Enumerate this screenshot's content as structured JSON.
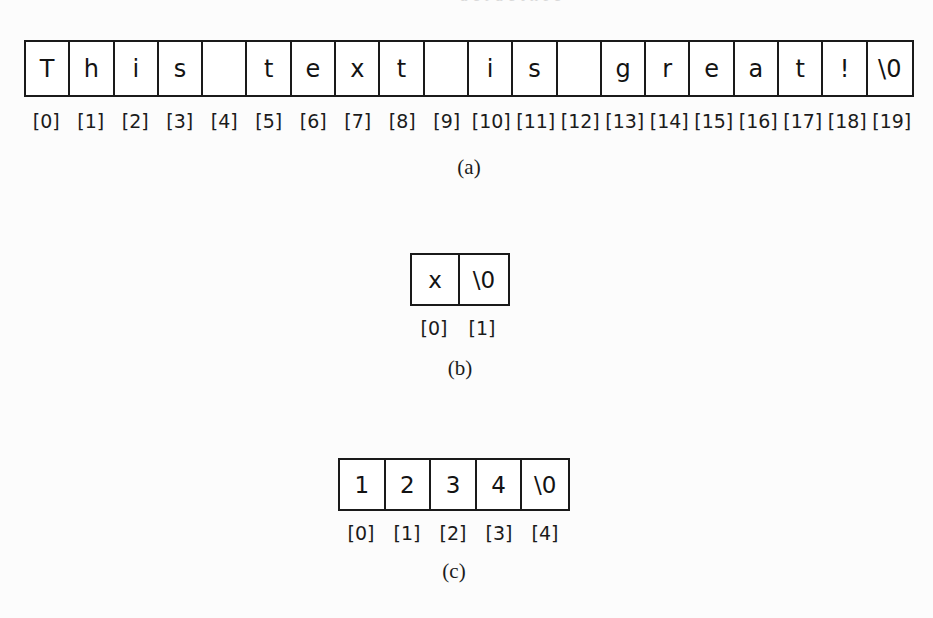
{
  "page": {
    "background_color": "#fcfcfc",
    "ink_color": "#1a1a1a",
    "top_bleed_text": "a e r a e t n f e"
  },
  "panels": [
    {
      "id": "a",
      "caption": "(a)",
      "string_value": "This text is great!",
      "cells": [
        "T",
        "h",
        "i",
        "s",
        "",
        "t",
        "e",
        "x",
        "t",
        "",
        "i",
        "s",
        "",
        "g",
        "r",
        "e",
        "a",
        "t",
        "!",
        "\\0"
      ],
      "indices": [
        "[0]",
        "[1]",
        "[2]",
        "[3]",
        "[4]",
        "[5]",
        "[6]",
        "[7]",
        "[8]",
        "[9]",
        "[10]",
        "[11]",
        "[12]",
        "[13]",
        "[14]",
        "[15]",
        "[16]",
        "[17]",
        "[18]",
        "[19]"
      ],
      "cell_count": 20
    },
    {
      "id": "b",
      "caption": "(b)",
      "string_value": "x",
      "cells": [
        "x",
        "\\0"
      ],
      "indices": [
        "[0]",
        "[1]"
      ],
      "cell_count": 2
    },
    {
      "id": "c",
      "caption": "(c)",
      "string_value": "1234",
      "cells": [
        "1",
        "2",
        "3",
        "4",
        "\\0"
      ],
      "indices": [
        "[0]",
        "[1]",
        "[2]",
        "[3]",
        "[4]"
      ],
      "cell_count": 5
    }
  ]
}
